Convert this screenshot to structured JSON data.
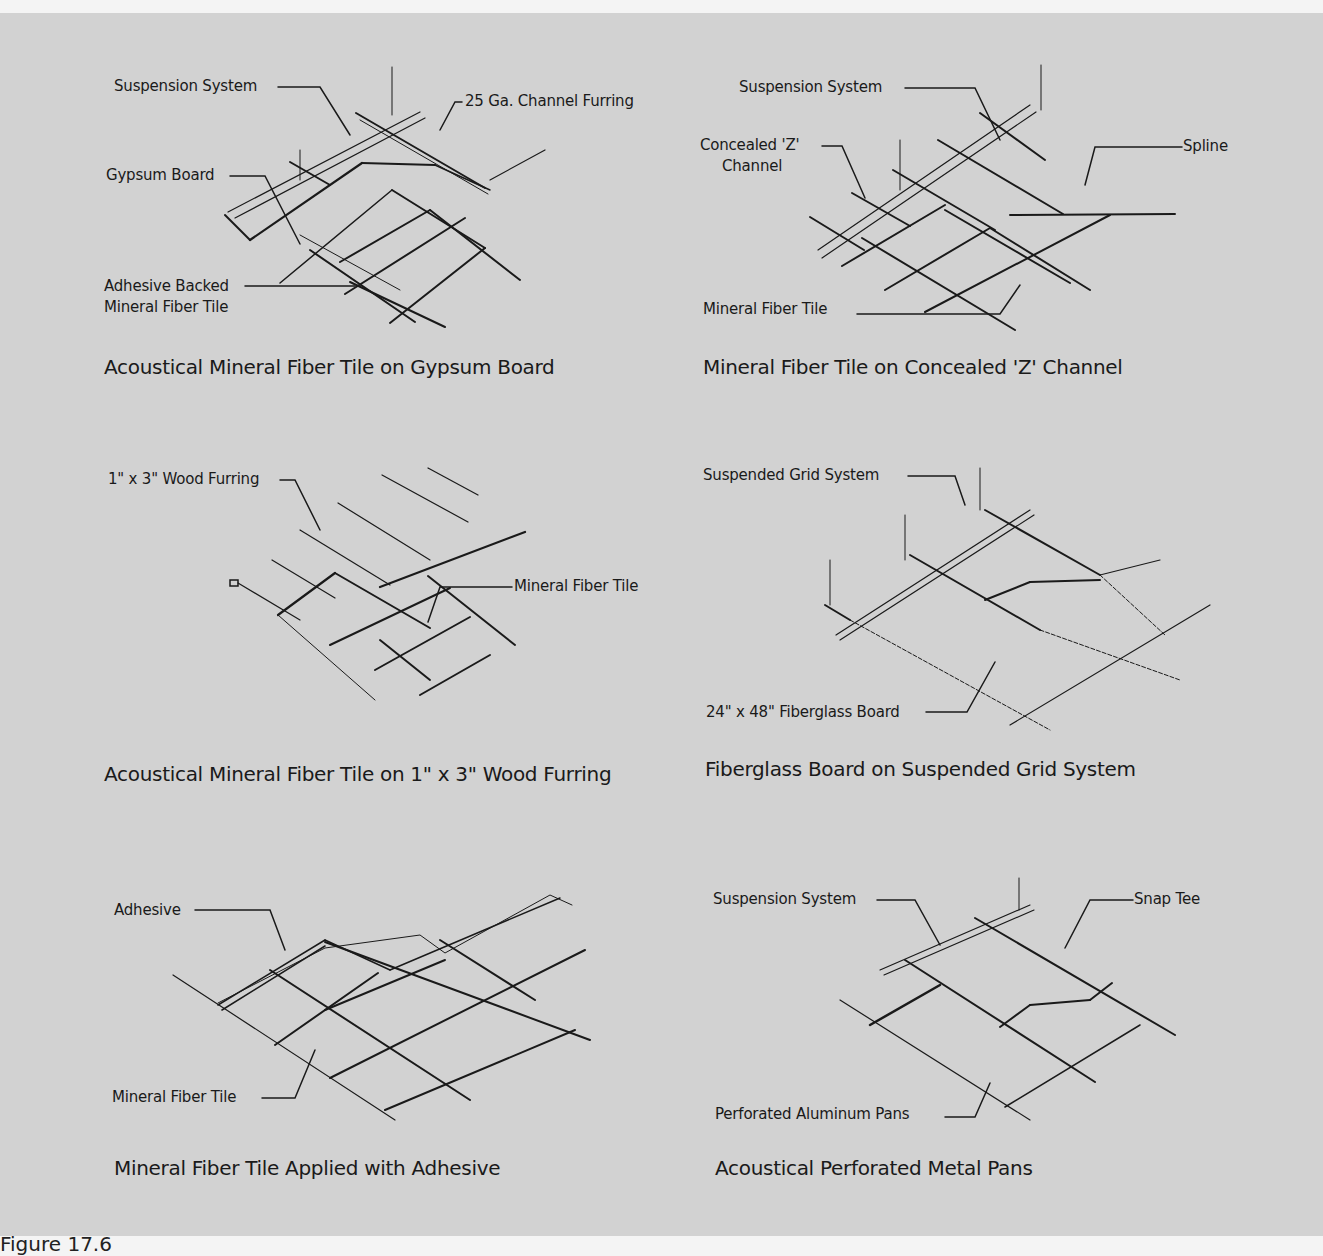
{
  "panels": [
    {
      "caption": "Acoustical Mineral Fiber Tile on Gypsum Board",
      "labels": [
        "Suspension System",
        "25 Ga. Channel Furring",
        "Gypsum Board",
        "Adhesive Backed",
        "Mineral Fiber Tile"
      ]
    },
    {
      "caption": "Mineral Fiber Tile on Concealed 'Z' Channel",
      "labels": [
        "Suspension System",
        "Concealed 'Z'",
        "Channel",
        "Spline",
        "Mineral Fiber Tile"
      ]
    },
    {
      "caption": "Acoustical Mineral Fiber Tile on 1\" x 3\" Wood Furring",
      "labels": [
        "1\" x 3\" Wood Furring",
        "Mineral Fiber Tile"
      ]
    },
    {
      "caption": "Fiberglass Board on Suspended Grid System",
      "labels": [
        "Suspended Grid System",
        "24\" x 48\" Fiberglass Board"
      ]
    },
    {
      "caption": "Mineral Fiber Tile Applied with Adhesive",
      "labels": [
        "Adhesive",
        "Mineral Fiber Tile"
      ]
    },
    {
      "caption": "Acoustical Perforated Metal Pans",
      "labels": [
        "Suspension System",
        "Snap Tee",
        "Perforated Aluminum Pans"
      ]
    }
  ],
  "figure_label": "Figure 17.6"
}
